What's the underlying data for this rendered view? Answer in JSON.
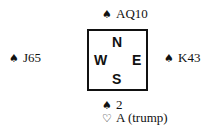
{
  "diagram": {
    "north": {
      "suit": "♠",
      "suit_name": "spade-icon",
      "cards": "AQ10"
    },
    "west": {
      "suit": "♠",
      "suit_name": "spade-icon",
      "cards": "J65"
    },
    "east": {
      "suit": "♠",
      "suit_name": "spade-icon",
      "cards": "K43"
    },
    "south": [
      {
        "suit": "♠",
        "suit_name": "spade-icon",
        "cards": "2"
      },
      {
        "suit": "♡",
        "suit_name": "heart-icon",
        "cards": "A (trump)"
      }
    ],
    "compass": {
      "n": "N",
      "w": "W",
      "e": "E",
      "s": "S"
    }
  }
}
